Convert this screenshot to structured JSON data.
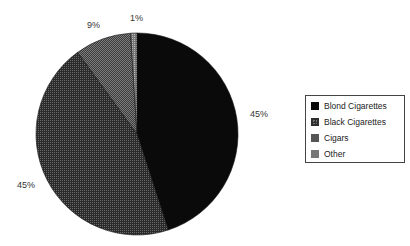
{
  "chart_data": {
    "type": "pie",
    "title": "",
    "categories": [
      "Blond Cigarettes",
      "Black Cigarettes",
      "Cigars",
      "Other"
    ],
    "values": [
      45,
      45,
      9,
      1
    ],
    "labels": [
      "45%",
      "45%",
      "9%",
      "1%"
    ],
    "colors": [
      "#0a0a0a",
      "#3a3a3a",
      "#555555",
      "#8a8a8a"
    ],
    "start_angle_deg": 0,
    "direction": "clockwise",
    "legend_position": "right"
  },
  "labels": {
    "blond": "45%",
    "black": "45%",
    "cigars": "9%",
    "other": "1%"
  },
  "legend": {
    "items": [
      {
        "label": "Blond Cigarettes",
        "color": "#0a0a0a"
      },
      {
        "label": "Black Cigarettes",
        "color": "#3a3a3a"
      },
      {
        "label": "Cigars",
        "color": "#555555"
      },
      {
        "label": "Other",
        "color": "#777777"
      }
    ]
  }
}
